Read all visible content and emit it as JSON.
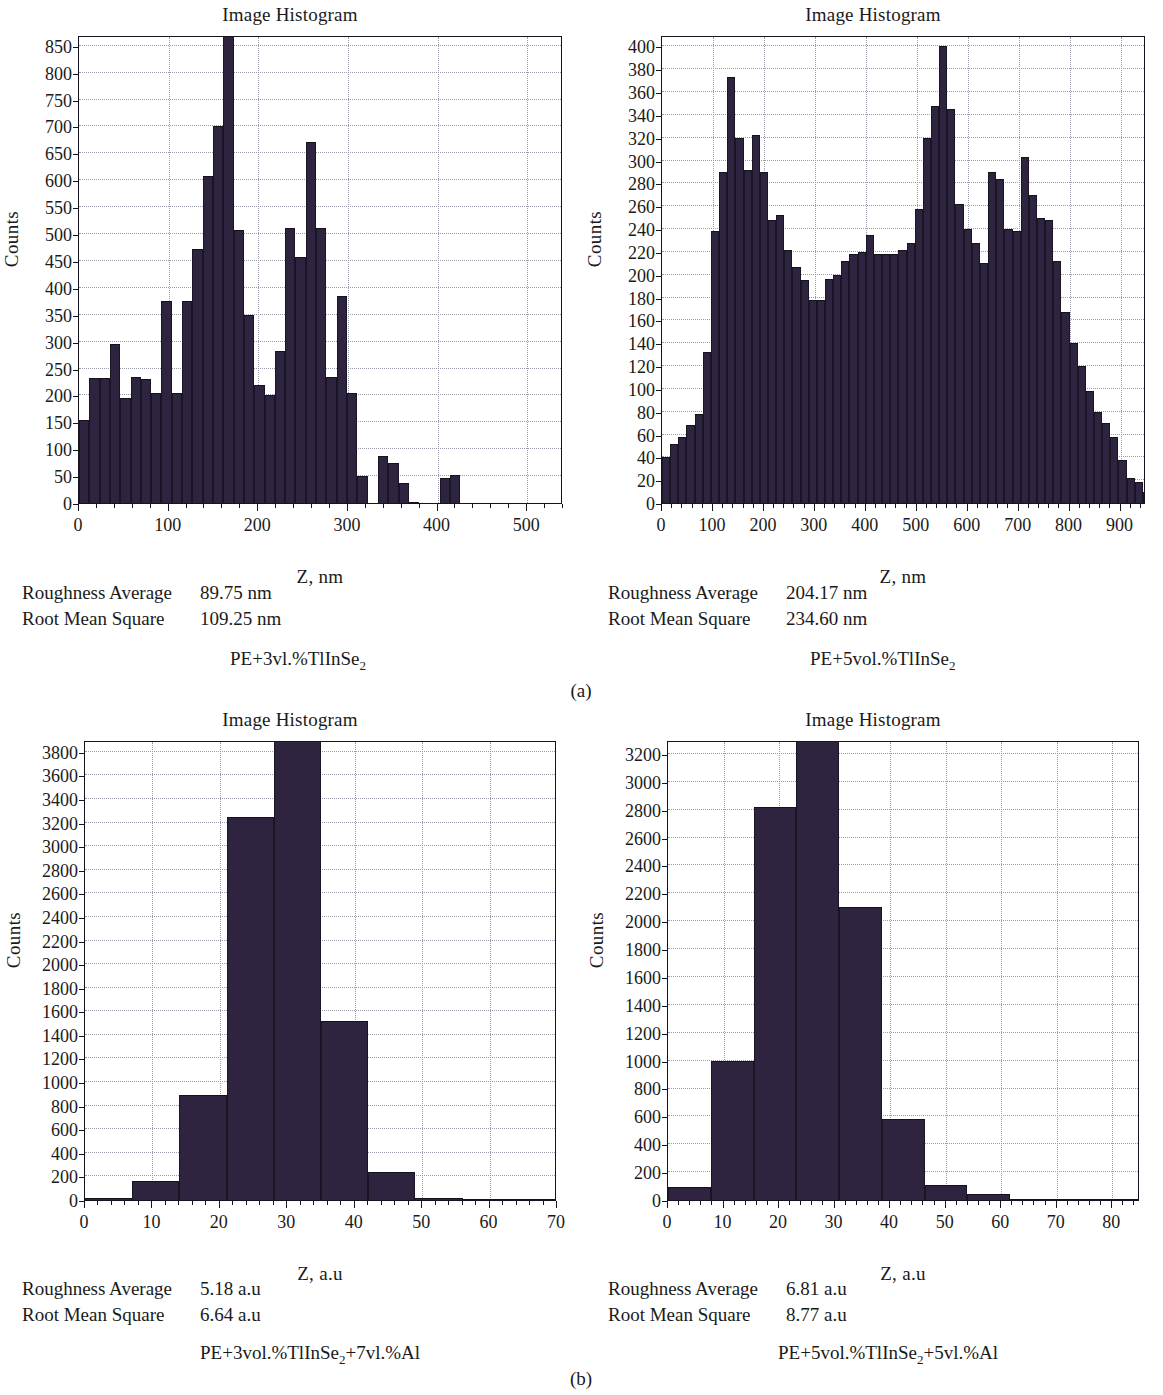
{
  "figure": {
    "panel_labels": [
      "(a)",
      "(b)"
    ],
    "bar_color": "#2e2440",
    "frame_color": "#15131f",
    "grid_color": "#9a9aa8",
    "stats_labels": {
      "roughness_average": "Roughness Average",
      "root_mean_square": "Root Mean Square"
    }
  },
  "chart_data": [
    {
      "id": "hist-top-left",
      "type": "bar",
      "title": "Image Histogram",
      "xlabel": "Z, nm",
      "ylabel": "Counts",
      "grid": true,
      "xlim": [
        0,
        540
      ],
      "ylim": [
        0,
        870
      ],
      "xticks": [
        0,
        100,
        200,
        300,
        400,
        500
      ],
      "yticks": [
        0,
        50,
        100,
        150,
        200,
        250,
        300,
        350,
        400,
        450,
        500,
        550,
        600,
        650,
        700,
        750,
        800,
        850
      ],
      "bin_width": 11.5,
      "bin_starts": [
        0,
        11.5,
        23,
        34.5,
        46,
        57.5,
        69,
        80.5,
        92,
        103.5,
        115,
        126.5,
        138,
        149.5,
        161,
        172.5,
        184,
        195.5,
        207,
        218.5,
        230,
        241.5,
        253,
        264.5,
        276,
        287.5,
        299,
        310.5,
        322,
        333.5,
        345,
        356.5,
        368,
        379.5,
        391,
        402.5,
        414,
        425.5,
        437,
        448.5,
        460,
        471.5,
        483,
        494.5,
        506,
        517.5,
        529
      ],
      "values": [
        155,
        232,
        232,
        295,
        195,
        235,
        230,
        205,
        375,
        205,
        375,
        473,
        608,
        700,
        870,
        508,
        350,
        220,
        200,
        282,
        512,
        458,
        672,
        512,
        235,
        385,
        205,
        50,
        0,
        88,
        75,
        37,
        2,
        0,
        0,
        46,
        52,
        0,
        0,
        0,
        0,
        0,
        0,
        0,
        0,
        0,
        0
      ],
      "stats": {
        "roughness_average": "89.75 nm",
        "root_mean_square": "109.25 nm"
      },
      "sample": "PE+3vl.%TlInSe",
      "sample_sub": "2"
    },
    {
      "id": "hist-top-right",
      "type": "bar",
      "title": "Image Histogram",
      "xlabel": "Z, nm",
      "ylabel": "Counts",
      "grid": true,
      "xlim": [
        0,
        950
      ],
      "ylim": [
        0,
        410
      ],
      "xticks": [
        0,
        100,
        200,
        300,
        400,
        500,
        600,
        700,
        800,
        900
      ],
      "yticks": [
        0,
        20,
        40,
        60,
        80,
        100,
        120,
        140,
        160,
        180,
        200,
        220,
        240,
        260,
        280,
        300,
        320,
        340,
        360,
        380,
        400
      ],
      "bin_width": 16,
      "bin_starts": [
        0,
        16,
        32,
        48,
        64,
        80,
        96,
        112,
        128,
        144,
        160,
        176,
        192,
        208,
        224,
        240,
        256,
        272,
        288,
        304,
        320,
        336,
        352,
        368,
        384,
        400,
        416,
        432,
        448,
        464,
        480,
        496,
        512,
        528,
        544,
        560,
        576,
        592,
        608,
        624,
        640,
        656,
        672,
        688,
        704,
        720,
        736,
        752,
        768,
        784,
        800,
        816,
        832,
        848,
        864,
        880,
        896,
        912,
        928,
        944
      ],
      "values": [
        40,
        52,
        58,
        68,
        78,
        132,
        238,
        290,
        373,
        320,
        292,
        322,
        290,
        248,
        252,
        222,
        207,
        195,
        178,
        178,
        196,
        200,
        212,
        218,
        220,
        235,
        218,
        218,
        218,
        222,
        228,
        258,
        320,
        348,
        400,
        345,
        262,
        240,
        228,
        210,
        290,
        284,
        240,
        238,
        303,
        270,
        250,
        248,
        212,
        167,
        140,
        120,
        98,
        80,
        70,
        58,
        38,
        22,
        18,
        10
      ],
      "stats": {
        "roughness_average": "204.17 nm",
        "root_mean_square": "234.60 nm"
      },
      "sample": "PE+5vol.%TlInSe",
      "sample_sub": "2"
    },
    {
      "id": "hist-bottom-left",
      "type": "bar",
      "title": "Image Histogram",
      "xlabel": "Z, a.u",
      "ylabel": "Counts",
      "grid": true,
      "xlim": [
        0,
        70
      ],
      "ylim": [
        0,
        3900
      ],
      "xticks": [
        0,
        10,
        20,
        30,
        40,
        50,
        60,
        70
      ],
      "yticks": [
        0,
        200,
        400,
        600,
        800,
        1000,
        1200,
        1400,
        1600,
        1800,
        2000,
        2200,
        2400,
        2600,
        2800,
        3000,
        3200,
        3400,
        3600,
        3800
      ],
      "bin_width": 7,
      "bin_starts": [
        0,
        7,
        14,
        21,
        28,
        35,
        42,
        49,
        56,
        63
      ],
      "values": [
        15,
        160,
        890,
        3250,
        3900,
        1520,
        240,
        20,
        5,
        5
      ],
      "stats": {
        "roughness_average": "5.18 a.u",
        "root_mean_square": "6.64 a.u"
      },
      "sample": "PE+3vol.%TlInSe",
      "sample_sub": "2",
      "sample_tail": "+7vl.%Al"
    },
    {
      "id": "hist-bottom-right",
      "type": "bar",
      "title": "Image Histogram",
      "xlabel": "Z, a.u",
      "ylabel": "Counts",
      "grid": true,
      "xlim": [
        0,
        85
      ],
      "ylim": [
        0,
        3300
      ],
      "xticks": [
        0,
        10,
        20,
        30,
        40,
        50,
        60,
        70,
        80
      ],
      "yticks": [
        0,
        200,
        400,
        600,
        800,
        1000,
        1200,
        1400,
        1600,
        1800,
        2000,
        2200,
        2400,
        2600,
        2800,
        3000,
        3200
      ],
      "bin_width": 7.7,
      "bin_starts": [
        0,
        7.7,
        15.4,
        23.1,
        30.8,
        38.5,
        46.2,
        53.9,
        61.6,
        69.3,
        77
      ],
      "values": [
        90,
        1000,
        2820,
        3300,
        2100,
        580,
        110,
        40,
        5,
        5,
        5
      ],
      "stats": {
        "roughness_average": "6.81 a.u",
        "root_mean_square": "8.77 a.u"
      },
      "sample": "PE+5vol.%TlInSe",
      "sample_sub": "2",
      "sample_tail": "+5vl.%Al"
    }
  ]
}
